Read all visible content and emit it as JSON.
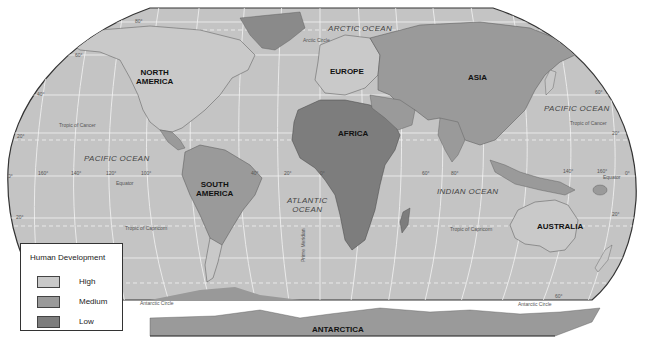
{
  "legend": {
    "title": "Human Development",
    "items": [
      {
        "label": "High",
        "color": "#c9c9c9"
      },
      {
        "label": "Medium",
        "color": "#9a9a9a"
      },
      {
        "label": "Low",
        "color": "#7d7d7d"
      }
    ]
  },
  "colors": {
    "ocean": "#c4c4c4",
    "border": "#333333",
    "grid": "#f2f2f2",
    "high": "#c9c9c9",
    "medium": "#9a9a9a",
    "low": "#7d7d7d"
  },
  "continents": {
    "north_america": "NORTH\nAMERICA",
    "south_america": "SOUTH\nAMERICA",
    "europe": "EUROPE",
    "africa": "AFRICA",
    "asia": "ASIA",
    "australia": "AUSTRALIA",
    "antarctica": "ANTARCTICA"
  },
  "oceans": {
    "arctic": "ARCTIC OCEAN",
    "pacific_west": "PACIFIC  OCEAN",
    "pacific_east": "PACIFIC  OCEAN",
    "atlantic": "ATLANTIC\nOCEAN",
    "indian": "INDIAN  OCEAN"
  },
  "lines": {
    "arctic_circle": "Arctic Circle",
    "tropic_cancer_w": "Tropic of Cancer",
    "tropic_cancer_e": "Tropic of Cancer",
    "equator_w": "Equator",
    "equator_e": "Equator",
    "tropic_capricorn_w": "Tropic of Capricorn",
    "tropic_capricorn_e": "Tropic of Capricorn",
    "antarctic_circle_w": "Antarctic Circle",
    "antarctic_circle_e": "Antarctic Circle",
    "prime_meridian": "Prime Meridian"
  },
  "degrees": {
    "lat_80n": "80°",
    "lat_60n_w": "60°",
    "lat_40n_w": "40°",
    "lat_20n_w": "20°",
    "lat_0_w": "0°",
    "lat_20s_w": "20°",
    "lat_60n_e": "60°",
    "lat_20n_e": "20°",
    "lat_0_e": "0°",
    "lat_20s_e": "20°",
    "lat_60s_e": "60°",
    "lon_160w": "160°",
    "lon_140w": "140°",
    "lon_120w": "120°",
    "lon_100w": "100°",
    "lon_40w": "40°",
    "lon_20w": "20°",
    "lon_0": "0°",
    "lon_60e": "60°",
    "lon_80e": "80°",
    "lon_140e": "140°",
    "lon_160e": "160°"
  }
}
